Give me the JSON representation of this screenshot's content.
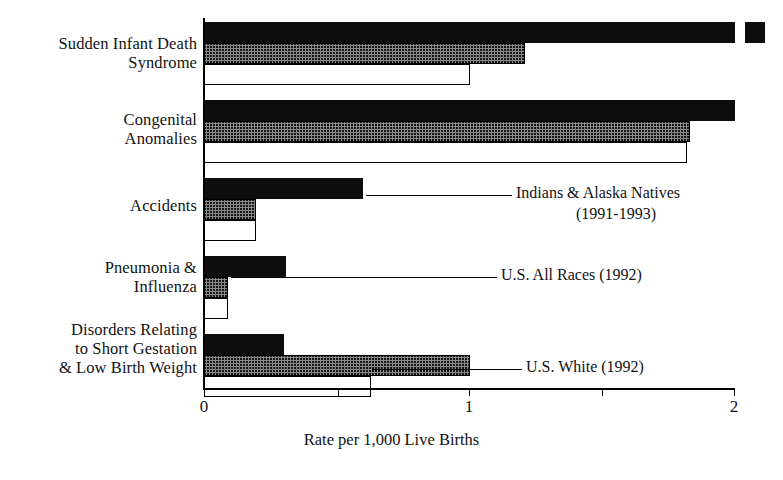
{
  "chart_data": {
    "type": "bar",
    "orientation": "horizontal",
    "title": "",
    "xlabel": "Rate per 1,000 Live Births",
    "ylabel": "",
    "xlim": [
      0,
      2
    ],
    "xticks": [
      0,
      0.5,
      1,
      1.5,
      2
    ],
    "xtick_labels": [
      "0",
      "",
      "1",
      "",
      "2"
    ],
    "grid": false,
    "legend_position": "inline-annotations",
    "categories": [
      "Sudden Infant Death\nSyndrome",
      "Congenital\nAnomalies",
      "Accidents",
      "Pneumonia &\nInfluenza",
      "Disorders Relating\nto Short Gestation\n& Low Birth Weight"
    ],
    "series": [
      {
        "name": "Indians & Alaska Natives",
        "period": "(1991-1993)",
        "fill": "black",
        "values": [
          2.12,
          2.0,
          0.6,
          0.31,
          0.3
        ]
      },
      {
        "name": "U.S. All Races (1992)",
        "period": "",
        "fill": "hatched-gray",
        "values": [
          1.21,
          1.83,
          0.195,
          0.09,
          1.0
        ]
      },
      {
        "name": "U.S. White (1992)",
        "period": "",
        "fill": "white",
        "values": [
          1.0,
          1.82,
          0.195,
          0.09,
          0.63
        ]
      }
    ],
    "annotations": [
      {
        "label": "Indians & Alaska Natives",
        "sublabel": "(1991-1993)"
      },
      {
        "label": "U.S. All Races (1992)",
        "sublabel": ""
      },
      {
        "label": "U.S. White (1992)",
        "sublabel": ""
      }
    ]
  }
}
